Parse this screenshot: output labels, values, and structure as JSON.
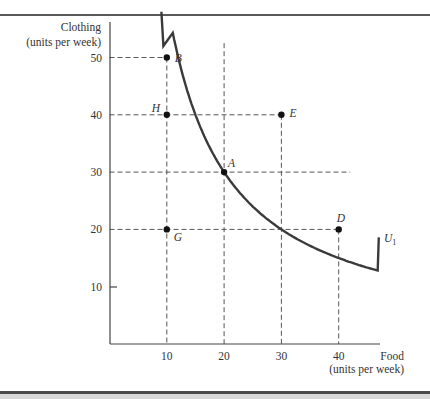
{
  "chart_data": {
    "type": "line",
    "title": "",
    "xlabel": "Food (units per week)",
    "ylabel": "Clothing (units per week)",
    "xlabel_lines": [
      "Food",
      "(units per week)"
    ],
    "ylabel_lines": [
      "Clothing",
      "(units per week)"
    ],
    "xlim": [
      0,
      48
    ],
    "ylim": [
      0,
      56
    ],
    "x_ticks": [
      10,
      20,
      30,
      40
    ],
    "y_ticks": [
      10,
      20,
      30,
      40,
      50
    ],
    "grid": false,
    "series": [
      {
        "name": "U1",
        "label": "U",
        "label_subscript": "1",
        "kind": "indifference-curve",
        "x": [
          10,
          12.5,
          15,
          20,
          25,
          30,
          35,
          40,
          47
        ],
        "y": [
          50,
          40,
          35,
          30,
          26,
          23,
          21.2,
          20,
          18.8
        ]
      }
    ],
    "points": [
      {
        "label": "A",
        "x": 20,
        "y": 30
      },
      {
        "label": "B",
        "x": 10,
        "y": 50
      },
      {
        "label": "D",
        "x": 40,
        "y": 20
      },
      {
        "label": "E",
        "x": 30,
        "y": 40
      },
      {
        "label": "G",
        "x": 10,
        "y": 20
      },
      {
        "label": "H",
        "x": 10,
        "y": 40
      }
    ],
    "reference_lines": {
      "horizontal_dashed": [
        50,
        40,
        30,
        20
      ],
      "vertical_dashed": [
        10,
        20,
        30,
        40
      ]
    },
    "legend": "none; curve labeled U1 at right end"
  }
}
